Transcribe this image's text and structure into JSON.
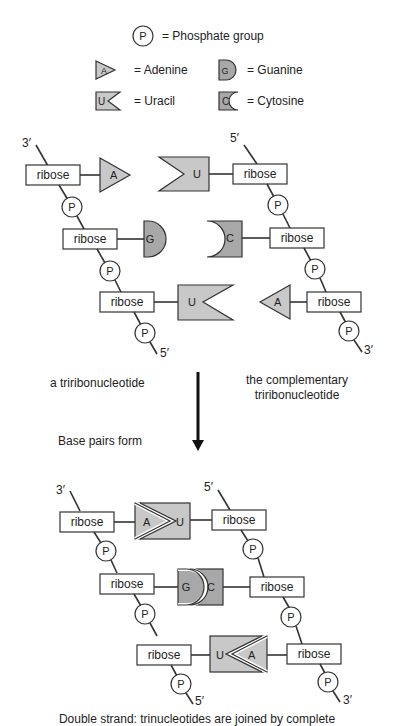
{
  "legend": {
    "phosphate_symbol": "P",
    "phosphate_label": "= Phosphate group",
    "adenine_symbol": "A",
    "adenine_label": "= Adenine",
    "guanine_symbol": "G",
    "guanine_label": "= Guanine",
    "uracil_symbol": "U",
    "uracil_label": "= Uracil",
    "cytosine_symbol": "C",
    "cytosine_label": "= Cytosine"
  },
  "sugar_label": "ribose",
  "phosphate_label": "P",
  "end_3": "3′",
  "end_5": "5′",
  "top": {
    "left_strand_bases": [
      "A",
      "G",
      "U"
    ],
    "right_strand_bases": [
      "U",
      "C",
      "A"
    ],
    "left_caption": "a triribonucleotide",
    "right_caption_line1": "the complementary",
    "right_caption_line2": "triribonucleotide"
  },
  "arrow_label": "Base pairs form",
  "bottom": {
    "pairs": [
      {
        "left": "A",
        "right": "U"
      },
      {
        "left": "G",
        "right": "C"
      },
      {
        "left": "U",
        "right": "A"
      }
    ],
    "caption": "Double strand: trinucleotides are joined by complete"
  }
}
